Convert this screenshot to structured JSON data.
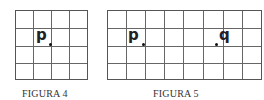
{
  "figures": [
    {
      "caption": "FIGURA 4",
      "grid": {
        "cols": 4,
        "rows": 4
      },
      "points": [
        {
          "label": "p",
          "col": 2,
          "row": 2
        }
      ]
    },
    {
      "caption": "FIGURA 5",
      "grid": {
        "cols": 8,
        "rows": 4
      },
      "points": [
        {
          "label": "p",
          "col": 2,
          "row": 2
        },
        {
          "label": "q",
          "col": 6,
          "row": 2
        }
      ]
    }
  ]
}
